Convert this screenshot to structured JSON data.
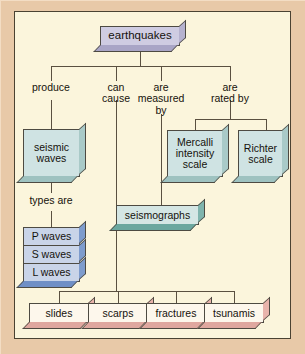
{
  "diagram": {
    "colors": {
      "mat": "#e8c9a8",
      "panel": "#fbf5dc",
      "frame_border": "#4a4232",
      "line": "#5a5040",
      "root_fill": "#cfcce2",
      "teal_fill": "#cfe3e3",
      "seismograph_fill": "#d4e6e4",
      "waves_fill": "#c9d4e8",
      "effects_fill": "#fdf7ec",
      "effects_side": "#e8b3ab"
    },
    "root": {
      "label": "earthquakes"
    },
    "edge_labels": [
      {
        "id": "produce",
        "text": "produce"
      },
      {
        "id": "can-cause",
        "text": "can\ncause"
      },
      {
        "id": "measured-by",
        "text": "are\nmeasured\nby"
      },
      {
        "id": "rated-by",
        "text": "are\nrated by"
      },
      {
        "id": "types-are",
        "text": "types are"
      }
    ],
    "nodes": [
      {
        "id": "seismic-waves",
        "text": "seismic\nwaves"
      },
      {
        "id": "seismographs",
        "text": "seismographs"
      },
      {
        "id": "mercalli",
        "text": "Mercalli\nintensity\nscale"
      },
      {
        "id": "richter",
        "text": "Richter\nscale"
      }
    ],
    "wave_types": [
      {
        "id": "p-waves",
        "text": "P waves"
      },
      {
        "id": "s-waves",
        "text": "S waves"
      },
      {
        "id": "l-waves",
        "text": "L waves"
      }
    ],
    "effects": [
      {
        "id": "slides",
        "text": "slides"
      },
      {
        "id": "scarps",
        "text": "scarps"
      },
      {
        "id": "fractures",
        "text": "fractures"
      },
      {
        "id": "tsunamis",
        "text": "tsunamis"
      }
    ]
  }
}
